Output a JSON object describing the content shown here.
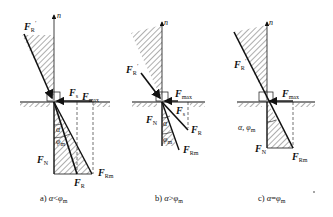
{
  "diagram": {
    "type": "friction self-locking force diagrams",
    "colors": {
      "line": "#111111",
      "hatch": "#333333",
      "background": "#ffffff"
    },
    "panels": [
      {
        "id": "a",
        "caption": "a) α<φm",
        "caption_parts": {
          "prefix": "a)",
          "alpha": "α",
          "rel": "<",
          "phi": "φ",
          "sub": "m"
        },
        "labels": {
          "normal_axis": "n",
          "FR_prime": {
            "main": "F",
            "sub": "R",
            "sup": "′"
          },
          "Fs": {
            "main": "F",
            "sub": "s"
          },
          "Fmax": {
            "main": "F",
            "sub": "max"
          },
          "FN": {
            "main": "F",
            "sub": "N"
          },
          "FR": {
            "main": "F",
            "sub": "R"
          },
          "FRm": {
            "main": "F",
            "sub": "Rm"
          },
          "alpha": "α",
          "phi_m": {
            "main": "φ",
            "sub": "m"
          }
        }
      },
      {
        "id": "b",
        "caption": "b) α>φm",
        "caption_parts": {
          "prefix": "b)",
          "alpha": "α",
          "rel": ">",
          "phi": "φ",
          "sub": "m"
        },
        "labels": {
          "normal_axis": "n",
          "FR_prime": {
            "main": "F",
            "sub": "R",
            "sup": "′"
          },
          "Fmax": {
            "main": "F",
            "sub": "max"
          },
          "Fs": {
            "main": "F",
            "sub": "s"
          },
          "FN": {
            "main": "F",
            "sub": "N"
          },
          "FR": {
            "main": "F",
            "sub": "R"
          },
          "FRm": {
            "main": "F",
            "sub": "Rm"
          },
          "alpha": "α",
          "phi_m": {
            "main": "φ",
            "sub": "m"
          }
        }
      },
      {
        "id": "c",
        "caption": "c) α=φm",
        "caption_parts": {
          "prefix": "c)",
          "alpha": "α",
          "rel": "=",
          "phi": "φ",
          "sub": "m"
        },
        "labels": {
          "normal_axis": "n",
          "FR_prime": {
            "main": "F",
            "sub": "R",
            "sup": "′"
          },
          "Fmax": {
            "main": "F",
            "sub": "max"
          },
          "FN": {
            "main": "F",
            "sub": "N"
          },
          "FRm": {
            "main": "F",
            "sub": "Rm"
          },
          "alpha_phi": {
            "alpha": "α",
            "sep": ",",
            "phi": "φ",
            "sub": "m"
          }
        }
      }
    ]
  }
}
